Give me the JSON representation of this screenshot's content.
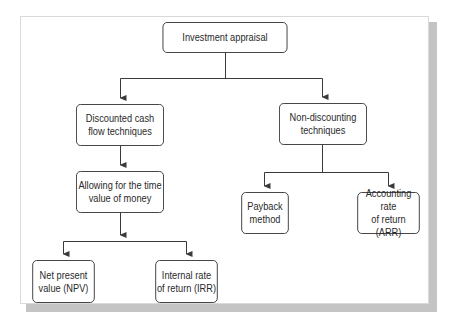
{
  "diagram": {
    "type": "hierarchy",
    "root": {
      "id": "investment-appraisal",
      "label": "Investment appraisal",
      "children": [
        {
          "id": "dcf",
          "label": "Discounted cash\nflow techniques",
          "children": [
            {
              "id": "time-value",
              "label": "Allowing for the time\nvalue of money",
              "children": [
                {
                  "id": "npv",
                  "label": "Net present\nvalue (NPV)"
                },
                {
                  "id": "irr",
                  "label": "Internal rate\nof return (IRR)"
                }
              ]
            }
          ]
        },
        {
          "id": "non-discounting",
          "label": "Non-discounting\ntechniques",
          "children": [
            {
              "id": "payback",
              "label": "Payback\nmethod"
            },
            {
              "id": "arr",
              "label": "Accounting rate\nof return (ARR)"
            }
          ]
        }
      ]
    }
  },
  "nodes": {
    "root": "Investment appraisal",
    "dcf": "Discounted cash\nflow techniques",
    "time_value": "Allowing for the time\nvalue of money",
    "npv": "Net present\nvalue (NPV)",
    "irr": "Internal rate\nof return (IRR)",
    "non_discounting": "Non-discounting\ntechniques",
    "payback": "Payback\nmethod",
    "arr": "Accounting rate\nof return (ARR)"
  },
  "colors": {
    "line": "#3a3a3a",
    "shadow": "#c4c4c4",
    "panel_border": "#d9d9d9"
  }
}
